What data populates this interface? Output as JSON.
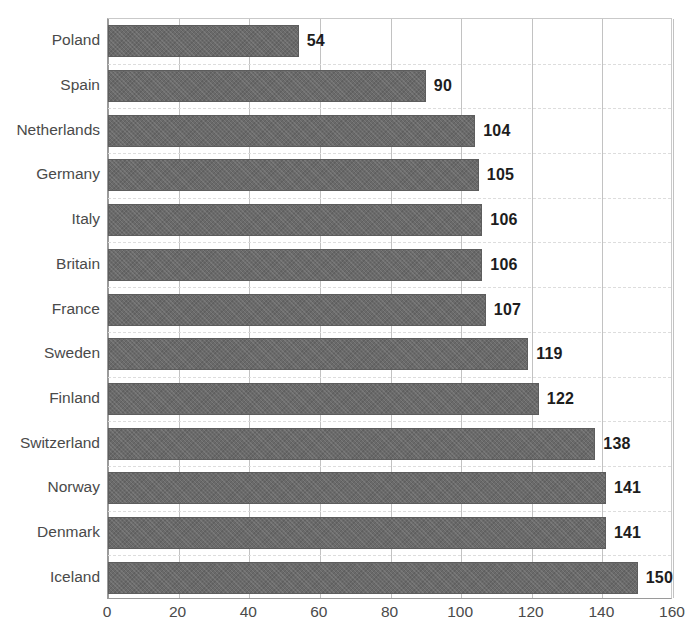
{
  "chart_data": {
    "type": "bar",
    "orientation": "horizontal",
    "title": "",
    "subtitle": "",
    "xlabel": "",
    "ylabel": "",
    "categories": [
      "Poland",
      "Spain",
      "Netherlands",
      "Germany",
      "Italy",
      "Britain",
      "France",
      "Sweden",
      "Finland",
      "Switzerland",
      "Norway",
      "Denmark",
      "Iceland"
    ],
    "values": [
      54,
      90,
      104,
      105,
      106,
      106,
      107,
      119,
      122,
      138,
      141,
      141,
      150
    ],
    "data_labels": [
      "54",
      "90",
      "104",
      "105",
      "106",
      "106",
      "107",
      "119",
      "122",
      "138",
      "141",
      "141",
      "150"
    ],
    "xlim": [
      0,
      160
    ],
    "xticks": [
      0,
      20,
      40,
      60,
      80,
      100,
      120,
      140,
      160
    ],
    "xtick_labels": [
      "0",
      "20",
      "40",
      "60",
      "80",
      "100",
      "120",
      "140",
      "160"
    ],
    "grid": "vertical",
    "legend": "none",
    "series": [
      {
        "name": "",
        "values": [
          54,
          90,
          104,
          105,
          106,
          106,
          107,
          119,
          122,
          138,
          141,
          141,
          150
        ]
      }
    ],
    "colors": {
      "bar_fill": "#6a6a6a",
      "bar_border": "#5d5d5d",
      "gridline": "#c2c2c2",
      "axis": "#9a9a9a",
      "category_label": "#4a4a4a",
      "value_label": "#1d1d1d",
      "background": "#ffffff"
    }
  }
}
